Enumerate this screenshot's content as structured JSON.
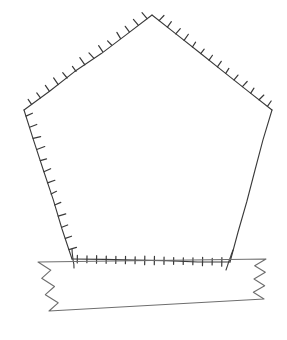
{
  "figure": {
    "kind": "line-drawing",
    "canvas": {
      "width": 287,
      "height": 340,
      "background_color": "#ffffff"
    },
    "style": {
      "line_color": "#3a3a3a",
      "banner_line_color": "#6e6e6e",
      "line_width": 1.1,
      "tick_line_width": 1.2,
      "tick_length": 7
    },
    "pentagon": {
      "name": "pentagon-outline",
      "vertex_labels": [
        "apex",
        "upper-left",
        "lower-left",
        "lower-right",
        "upper-right"
      ],
      "vertices": [
        {
          "label": "apex",
          "x": 152,
          "y": 15
        },
        {
          "label": "upper-left",
          "x": 24,
          "y": 110
        },
        {
          "label": "lower-left",
          "x": 72,
          "y": 259
        },
        {
          "label": "lower-right",
          "x": 230,
          "y": 262
        },
        {
          "label": "upper-right",
          "x": 272,
          "y": 110
        }
      ],
      "edges": [
        {
          "name": "edge-apex-to-upper-left",
          "from": 0,
          "to": 1,
          "hatched": true,
          "tick_count": 14,
          "tick_side": "outward"
        },
        {
          "name": "edge-upper-left-to-lower-left",
          "from": 1,
          "to": 2,
          "hatched": true,
          "tick_count": 13,
          "tick_side": "inward"
        },
        {
          "name": "edge-lower-left-to-lower-right",
          "from": 2,
          "to": 3,
          "hatched": true,
          "tick_count": 16,
          "tick_side": "both"
        },
        {
          "name": "edge-lower-right-to-upper-right",
          "from": 3,
          "to": 4,
          "hatched": false,
          "tick_count": 0,
          "tick_side": "none"
        },
        {
          "name": "edge-upper-right-to-apex",
          "from": 4,
          "to": 0,
          "hatched": true,
          "tick_count": 14,
          "tick_side": "outward"
        }
      ]
    },
    "banner": {
      "name": "notched-banner",
      "top_left": {
        "x": 38,
        "y": 262
      },
      "top_right": {
        "x": 266,
        "y": 259
      },
      "bottom_left": {
        "x": 49,
        "y": 311
      },
      "bottom_right": {
        "x": 264,
        "y": 299
      },
      "left_notch": {
        "name": "left-zigzag-edge",
        "peaks": 3,
        "amplitude": 11
      },
      "right_notch": {
        "name": "right-zigzag-edge",
        "peaks": 3,
        "amplitude": 11
      },
      "has_text": false,
      "text": ""
    },
    "annotations": {
      "labels": [],
      "numbers": []
    }
  }
}
